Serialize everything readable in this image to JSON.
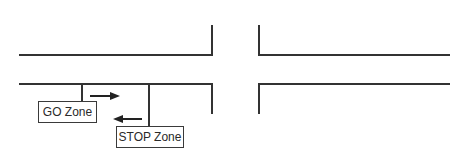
{
  "diagram": {
    "type": "intersection-zones",
    "line_color": "#333333",
    "background": "#ffffff",
    "road": {
      "left_segment": {
        "top_y": 55,
        "bottom_y": 84,
        "x_start": 20,
        "x_end": 212
      },
      "right_segment": {
        "top_y": 55,
        "bottom_y": 84,
        "x_start": 259,
        "x_end": 449
      },
      "cross_street": {
        "left_x": 212,
        "right_x": 259,
        "top_y": 26,
        "bottom_y": 113
      }
    },
    "zones": [
      {
        "label": "GO Zone",
        "box": {
          "x": 38,
          "y": 101,
          "w": 59,
          "h": 22
        },
        "connector_x": 82
      },
      {
        "label": "STOP Zone",
        "box": {
          "x": 116,
          "y": 126,
          "w": 68,
          "h": 22
        },
        "connector_x": 149
      }
    ],
    "arrows": [
      {
        "direction": "right",
        "y": 96,
        "x_from": 90,
        "x_to": 119
      },
      {
        "direction": "left",
        "y": 119,
        "x_from": 142,
        "x_to": 113
      }
    ]
  }
}
